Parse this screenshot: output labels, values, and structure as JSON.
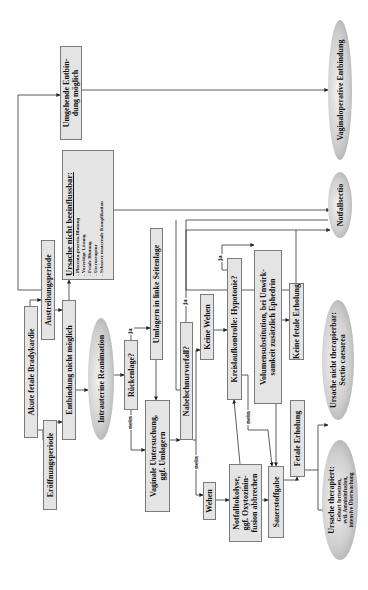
{
  "diagram": {
    "orientation": "rotated-90-ccw",
    "colors": {
      "box_fill": "#e4e4e4",
      "box_border": "#7a7a7a",
      "ellipse_fill": "#c8c8c8",
      "line": "#333333"
    },
    "nodes": {
      "start": "Akute fetale Bradykardie",
      "eroeffnung": "Eröffnungsperiode",
      "austreibung": "Austreibungsperiode",
      "entbindung_nicht": "Entbindung nicht möglich",
      "ursache_nicht_beeinflussbar": {
        "title": "Ursache nicht beeinflussbar:",
        "items": [
          "- Placenta-praevia-Blutung",
          "- Vorzeitige Lösung",
          "- Fetale Blutung",
          "- Uterusruptur",
          "- Schwere maternale Komplikation"
        ]
      },
      "umgehende": {
        "line1": "Umgehende Entbin-",
        "line2": "dung möglich"
      },
      "reanimation": "Intrauterine Reanimation",
      "rueckenlage": "Rückenlage?",
      "umlagern": "Umlagern in linke Seitenlage",
      "vaginale": {
        "line1": "Vaginale Untersuchung,",
        "line2": "ggf. Umlagern"
      },
      "nabelschnur": "Nabelschnurvorfall?",
      "keine_wehen": "Keine Wehen",
      "wehen": "Wehen",
      "notfalltokolyse": {
        "line1": "Notfalltokolyse,",
        "line2": "ggf. Oxytozinin-",
        "line3": "fusion abbrechen"
      },
      "kreislauf": "Kreislaufkontrolle: Hypotonie?",
      "volumen": {
        "line1": "Volumensubstitution, bei Unwirk-",
        "line2": "samkeit zusätzlich Ephedrin"
      },
      "sauerstoff": "Sauerstoffgabe",
      "fetale_erholung": "Fetale Erholung",
      "keine_fetale_erholung": "Keine fetale Erholung",
      "ursache_therapiert": {
        "title": "Ursache therapiert:",
        "line1": "Geburt fortsetzen,",
        "line2": "evtl. Amnioinfusion,",
        "line3": "intensive Überwachung"
      },
      "ursache_nicht_therapierbar": {
        "line1": "Ursache nicht therapierbar:",
        "line2": "Sectio caesarea"
      },
      "notfallsectio": "Notfallsectio",
      "vaginaloperativ": "Vaginaloperative Entbindung"
    },
    "edge_labels": {
      "ja_rueckenlage": "ja",
      "nein_rueckenlage": "nein",
      "ja_nabelschnur": "ja",
      "nein_nabelschnur": "nein",
      "ja_hypotonie": "ja",
      "nein_hypotonie": "nein"
    }
  }
}
